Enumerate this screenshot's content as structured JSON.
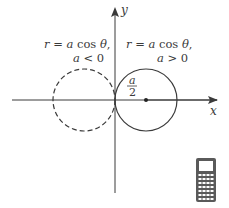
{
  "diagram": {
    "axes": {
      "x_label": "x",
      "y_label": "y"
    },
    "labels": {
      "left_eq": "r = a cos θ,",
      "left_cond": "a < 0",
      "right_eq": "r = a cos θ,",
      "right_cond": "a > 0",
      "radius_num": "a",
      "radius_den": "2"
    },
    "circles": [
      {
        "name": "a-negative",
        "center": [
          -0.5,
          0
        ],
        "radius": 0.5,
        "style": "dashed"
      },
      {
        "name": "a-positive",
        "center": [
          0.5,
          0
        ],
        "radius": 0.5,
        "style": "solid"
      }
    ],
    "icon": "graphing-calculator-icon",
    "colors": {
      "stroke": "#3a3a3a",
      "text": "#3a3a3a",
      "calculator": "#555555"
    }
  }
}
